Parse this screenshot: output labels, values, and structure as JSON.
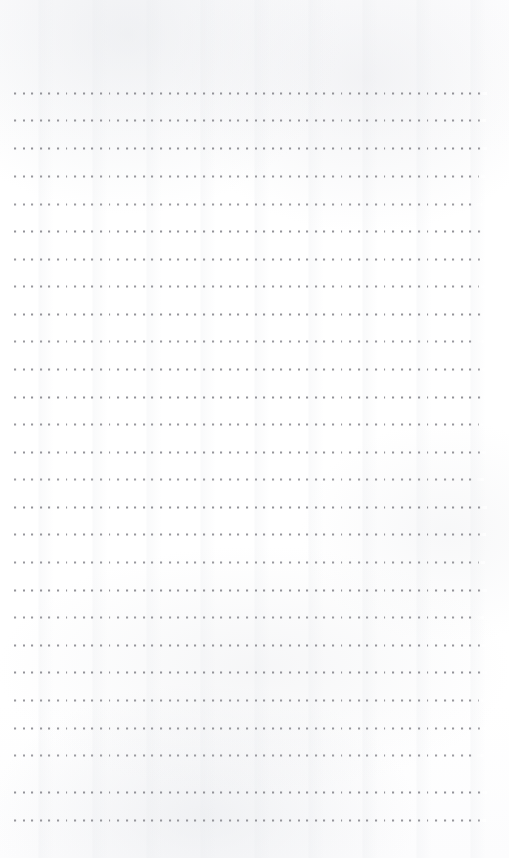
{
  "document": {
    "kind": "scanned-notebook-page",
    "page_label": "",
    "description": "Blank dotted-ruled notebook page",
    "width_px": 509,
    "height_px": 858,
    "background_color": "#fefefe",
    "dot_color": "#8b8b91",
    "content_text": ""
  },
  "ruling": {
    "style": "dotted",
    "row_count": 27,
    "first_row_y": 93,
    "row_pitch_y": 27.5,
    "dot_pitch_x": 8.6,
    "dot_size_px": 2,
    "margin_left": 14,
    "margin_right": 480,
    "margin_top": 93,
    "margin_bottom": 820,
    "rows": [
      {
        "y": 93,
        "x_start": 14,
        "x_end": 481,
        "opacity": 0.92
      },
      {
        "y": 120,
        "x_start": 14,
        "x_end": 480,
        "opacity": 0.9
      },
      {
        "y": 148,
        "x_start": 14,
        "x_end": 481,
        "opacity": 0.93
      },
      {
        "y": 176,
        "x_start": 14,
        "x_end": 479,
        "opacity": 0.88
      },
      {
        "y": 204,
        "x_start": 14,
        "x_end": 478,
        "opacity": 0.86
      },
      {
        "y": 231,
        "x_start": 14,
        "x_end": 481,
        "opacity": 0.93
      },
      {
        "y": 259,
        "x_start": 14,
        "x_end": 480,
        "opacity": 0.9
      },
      {
        "y": 286,
        "x_start": 14,
        "x_end": 479,
        "opacity": 0.88
      },
      {
        "y": 314,
        "x_start": 14,
        "x_end": 481,
        "opacity": 0.92
      },
      {
        "y": 341,
        "x_start": 14,
        "x_end": 478,
        "opacity": 0.87
      },
      {
        "y": 369,
        "x_start": 14,
        "x_end": 480,
        "opacity": 0.91
      },
      {
        "y": 397,
        "x_start": 14,
        "x_end": 481,
        "opacity": 0.93
      },
      {
        "y": 424,
        "x_start": 14,
        "x_end": 479,
        "opacity": 0.89
      },
      {
        "y": 452,
        "x_start": 14,
        "x_end": 480,
        "opacity": 0.91
      },
      {
        "y": 479,
        "x_start": 14,
        "x_end": 478,
        "opacity": 0.86
      },
      {
        "y": 507,
        "x_start": 14,
        "x_end": 481,
        "opacity": 0.92
      },
      {
        "y": 534,
        "x_start": 14,
        "x_end": 480,
        "opacity": 0.9
      },
      {
        "y": 562,
        "x_start": 14,
        "x_end": 479,
        "opacity": 0.88
      },
      {
        "y": 590,
        "x_start": 14,
        "x_end": 481,
        "opacity": 0.93
      },
      {
        "y": 617,
        "x_start": 14,
        "x_end": 478,
        "opacity": 0.87
      },
      {
        "y": 645,
        "x_start": 14,
        "x_end": 480,
        "opacity": 0.91
      },
      {
        "y": 672,
        "x_start": 14,
        "x_end": 481,
        "opacity": 0.92
      },
      {
        "y": 700,
        "x_start": 14,
        "x_end": 479,
        "opacity": 0.89
      },
      {
        "y": 728,
        "x_start": 14,
        "x_end": 480,
        "opacity": 0.9
      },
      {
        "y": 755,
        "x_start": 14,
        "x_end": 478,
        "opacity": 0.86
      },
      {
        "y": 792,
        "x_start": 14,
        "x_end": 481,
        "opacity": 0.92
      },
      {
        "y": 820,
        "x_start": 14,
        "x_end": 480,
        "opacity": 0.9
      }
    ]
  }
}
